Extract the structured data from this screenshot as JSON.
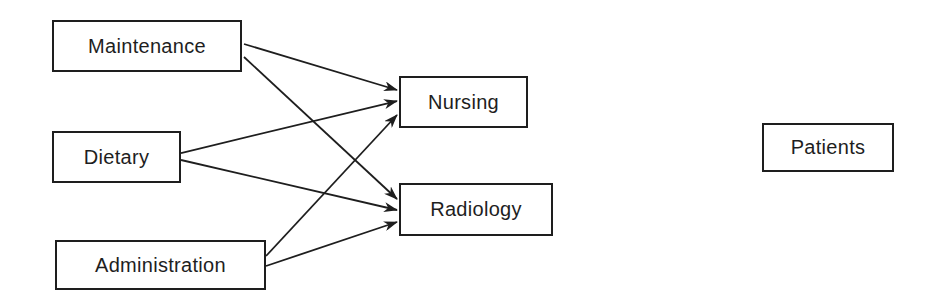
{
  "diagram": {
    "type": "flow",
    "nodes": {
      "maintenance": {
        "label": "Maintenance"
      },
      "dietary": {
        "label": "Dietary"
      },
      "administration": {
        "label": "Administration"
      },
      "nursing": {
        "label": "Nursing"
      },
      "radiology": {
        "label": "Radiology"
      },
      "patients": {
        "label": "Patients"
      }
    },
    "edges": [
      {
        "from": "Maintenance",
        "to": "Nursing"
      },
      {
        "from": "Maintenance",
        "to": "Radiology"
      },
      {
        "from": "Dietary",
        "to": "Nursing"
      },
      {
        "from": "Dietary",
        "to": "Radiology"
      },
      {
        "from": "Administration",
        "to": "Nursing"
      },
      {
        "from": "Administration",
        "to": "Radiology"
      }
    ],
    "colors": {
      "stroke": "#1e1e1e",
      "background": "#ffffff"
    }
  }
}
